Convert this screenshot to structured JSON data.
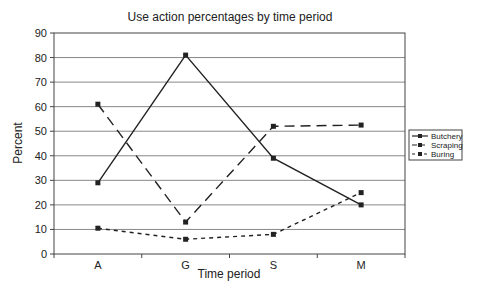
{
  "chart_data": {
    "type": "line",
    "title": "Use action percentages by time period",
    "xlabel": "Time period",
    "ylabel": "Percent",
    "categories": [
      "A",
      "G",
      "S",
      "M"
    ],
    "ylim": [
      0,
      90
    ],
    "yticks": [
      0,
      10,
      20,
      30,
      40,
      50,
      60,
      70,
      80,
      90
    ],
    "grid": true,
    "legend_position": "right",
    "series": [
      {
        "name": "Butchery",
        "values": [
          29,
          81,
          39,
          20
        ],
        "style": "solid"
      },
      {
        "name": "Scraping",
        "values": [
          61,
          13,
          52,
          52.5
        ],
        "style": "long-dash"
      },
      {
        "name": "Buring",
        "values": [
          10.5,
          6,
          8,
          25
        ],
        "style": "short-dash"
      }
    ]
  },
  "colors": {
    "line": "#222222",
    "grid": "#888888",
    "background": "#ffffff"
  }
}
